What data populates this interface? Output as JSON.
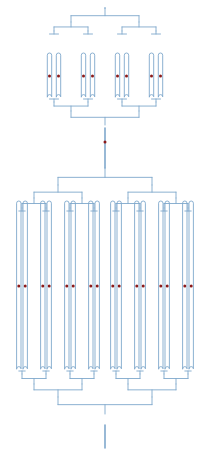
{
  "figure": {
    "width": 212,
    "height": 453,
    "background_color": "#ffffff"
  },
  "style": {
    "line_color": "#7fa8cc",
    "line_color_dark": "#6f9ec6",
    "line_width": 0.9,
    "node_color": "#8b1a1a",
    "node_radius": 1.5,
    "trunk_width": 1.6
  },
  "modules": [
    {
      "name": "upper-module",
      "label": "Upper network",
      "channel_count": 16,
      "branch_levels": 3,
      "node_row_y": 76,
      "top_trunk_y": 8,
      "bottom_trunk_y": 128,
      "clusters": [
        {
          "name": "upper-cluster-left",
          "center_x": 71,
          "channel_count": 8
        },
        {
          "name": "upper-cluster-right",
          "center_x": 140,
          "channel_count": 8
        }
      ]
    },
    {
      "name": "lower-module",
      "label": "Lower network",
      "channel_count": 32,
      "branch_levels": 4,
      "node_row_y": 286,
      "top_trunk_y": 168,
      "bottom_trunk_y": 425,
      "clusters": [
        {
          "name": "lower-cluster-1",
          "center_x": 36,
          "channel_count": 8
        },
        {
          "name": "lower-cluster-2",
          "center_x": 79,
          "channel_count": 8
        },
        {
          "name": "lower-cluster-3",
          "center_x": 128,
          "channel_count": 8
        },
        {
          "name": "lower-cluster-4",
          "center_x": 171,
          "channel_count": 8
        }
      ]
    }
  ],
  "trunk": {
    "name": "central-trunk",
    "center_x": 105,
    "inlet_top_y": 8,
    "outlet_bottom_y": 448,
    "mid_node": {
      "x": 105,
      "y": 142,
      "label": "midpoint node"
    }
  },
  "chart_data": {
    "type": "diagram",
    "node_marker_color": "#8b1a1a",
    "channel_color": "#7fa8cc",
    "marker_rows": [
      {
        "row": "upper-left",
        "y": 76,
        "count": 8
      },
      {
        "row": "upper-right",
        "y": 76,
        "count": 8
      },
      {
        "row": "trunk-mid",
        "y": 142,
        "count": 1
      },
      {
        "row": "lower",
        "y": 286,
        "count": 32
      }
    ],
    "total_markers": 49,
    "upper_channel_count": 16,
    "lower_channel_count": 32,
    "upper_channel_length_px": 46,
    "lower_channel_length_px": 200
  }
}
